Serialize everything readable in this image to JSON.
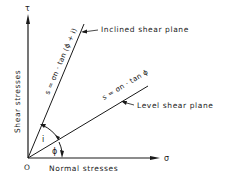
{
  "diagram": {
    "title": "",
    "axes": {
      "y_symbol": "τ",
      "y_label": "Shear stresses",
      "x_symbol": "σ",
      "x_label": "Normal stresses",
      "origin_label": "O"
    },
    "lines": [
      {
        "name": "Inclined shear plane",
        "equation": "s = σn · tan (ϕ + i)"
      },
      {
        "name": "Level shear plane",
        "equation": "s = σn · tan ϕ"
      }
    ],
    "angles": {
      "phi": "ϕ",
      "i": "i"
    }
  }
}
